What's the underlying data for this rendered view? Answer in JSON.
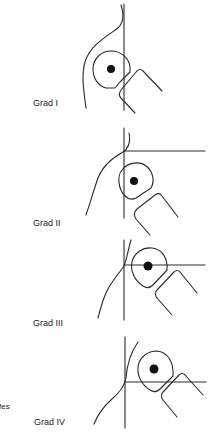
{
  "figure": {
    "panels": [
      {
        "label": "Grad I",
        "label_pos": [
          33,
          98
        ]
      },
      {
        "label": "Grad II",
        "label_pos": [
          33,
          218
        ]
      },
      {
        "label": "Grad III",
        "label_pos": [
          33,
          318
        ]
      },
      {
        "label": "Grad IV",
        "label_pos": [
          34,
          417
        ]
      }
    ],
    "edge_fragment": "fes",
    "colors": {
      "line": "#2a2a2a",
      "text": "#222222",
      "background": "#ffffff"
    }
  }
}
